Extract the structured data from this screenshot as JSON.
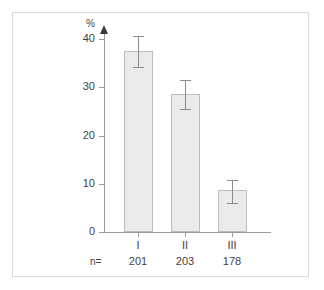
{
  "chart_data": {
    "type": "bar",
    "title": "",
    "subtitle": "",
    "xlabel": "",
    "ylabel": "%",
    "ylim": [
      0,
      40
    ],
    "yticks": [
      0,
      10,
      20,
      30,
      40
    ],
    "ytick_labels": [
      "0",
      "10",
      "20",
      "30",
      "40"
    ],
    "grid": false,
    "legend": null,
    "categories": [
      "I",
      "II",
      "III"
    ],
    "values": [
      37.5,
      28.6,
      8.8
    ],
    "errors_upper": [
      40.6,
      31.5,
      10.8
    ],
    "errors_lower": [
      34.2,
      25.4,
      6.1
    ],
    "error_note": "vertical error bars with caps at each end",
    "sample_size_prefix": "n=",
    "sample_sizes": [
      201,
      203,
      178
    ],
    "sample_sizes_text": [
      "201",
      "203",
      "178"
    ],
    "bar_fill_color": "#eaeaea",
    "bar_edge_color": "#bdbdbd",
    "axis_color": "#9a9a9a",
    "error_bar_color": "#8c8c8c",
    "text_color": "#3f3f3f",
    "frame_color": "#d8d8d8",
    "background_color": "#ffffff"
  }
}
